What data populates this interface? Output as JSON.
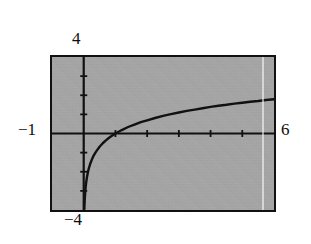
{
  "figure": {
    "kind": "graphing-calculator-plot",
    "background_color": "#ffffff",
    "plot_background_color": "#a9a9a9",
    "curve_color": "#111111",
    "axis_color": "#111111",
    "border_color": "#111111"
  },
  "labels": {
    "y_max": "4",
    "y_min": "−4",
    "x_min": "−1",
    "x_max": "6"
  },
  "chart_data": {
    "type": "line",
    "title": "",
    "subtitle": "",
    "xlabel": "",
    "ylabel": "",
    "xlim": [
      -1,
      6
    ],
    "ylim": [
      -4,
      4
    ],
    "grid": false,
    "legend": null,
    "x_tick_labels": [
      "−1",
      "6"
    ],
    "y_tick_labels": [
      "−4",
      "4"
    ],
    "x_tick_values": [
      1,
      2,
      3,
      4,
      5
    ],
    "y_tick_values": [
      -3,
      -2,
      -1,
      1,
      2,
      3
    ],
    "tick_interval_x": 1,
    "tick_interval_y": 1,
    "annotations": [
      "vertical asymptote at x = 0",
      "x-intercept at x = 1"
    ],
    "series": [
      {
        "name": "y = ln(x)",
        "values": [
          [
            0.02,
            -3.91
          ],
          [
            0.03,
            -3.51
          ],
          [
            0.05,
            -3.0
          ],
          [
            0.07,
            -2.66
          ],
          [
            0.1,
            -2.3
          ],
          [
            0.13,
            -2.04
          ],
          [
            0.16,
            -1.83
          ],
          [
            0.2,
            -1.61
          ],
          [
            0.25,
            -1.39
          ],
          [
            0.3,
            -1.2
          ],
          [
            0.35,
            -1.05
          ],
          [
            0.4,
            -0.92
          ],
          [
            0.5,
            -0.69
          ],
          [
            0.6,
            -0.51
          ],
          [
            0.7,
            -0.36
          ],
          [
            0.8,
            -0.22
          ],
          [
            0.9,
            -0.11
          ],
          [
            1.0,
            0.0
          ],
          [
            1.2,
            0.18
          ],
          [
            1.4,
            0.34
          ],
          [
            1.6,
            0.47
          ],
          [
            1.8,
            0.59
          ],
          [
            2.0,
            0.69
          ],
          [
            2.25,
            0.81
          ],
          [
            2.5,
            0.92
          ],
          [
            2.75,
            1.01
          ],
          [
            3.0,
            1.1
          ],
          [
            3.25,
            1.18
          ],
          [
            3.5,
            1.25
          ],
          [
            3.75,
            1.32
          ],
          [
            4.0,
            1.39
          ],
          [
            4.25,
            1.45
          ],
          [
            4.5,
            1.5
          ],
          [
            4.75,
            1.56
          ],
          [
            5.0,
            1.61
          ],
          [
            5.25,
            1.66
          ],
          [
            5.5,
            1.7
          ],
          [
            5.75,
            1.75
          ],
          [
            6.0,
            1.79
          ]
        ]
      }
    ]
  }
}
